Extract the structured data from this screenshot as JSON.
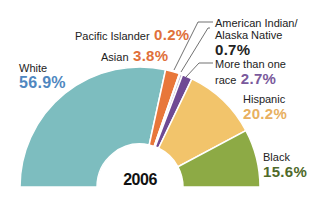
{
  "chart_data": {
    "type": "pie",
    "subtype": "half-donut",
    "title": "2006",
    "categories": [
      "White",
      "Asian",
      "Pacific Islander",
      "American Indian/Alaska Native",
      "More than one race",
      "Hispanic",
      "Black"
    ],
    "values": [
      56.9,
      3.8,
      0.2,
      0.7,
      2.7,
      20.2,
      15.6
    ],
    "unit": "%",
    "colors": [
      "#7dbdbf",
      "#e8773a",
      "#e8773a",
      "#c9c0d6",
      "#6f4a94",
      "#f2c46b",
      "#8daa45"
    ],
    "legend": "inline labels"
  },
  "labels": {
    "white": {
      "name": "White",
      "pct": "56.9%",
      "color": "#4f87c0"
    },
    "asian": {
      "name": "Asian",
      "pct": "3.8%",
      "color": "#e0703a"
    },
    "pacific": {
      "name": "Pacific Islander",
      "pct": "0.2%",
      "color": "#e0703a"
    },
    "amind": {
      "name1": "American Indian/",
      "name2": "Alaska Native",
      "pct": "0.7%",
      "color": "#222222"
    },
    "multi": {
      "name1": "More than one",
      "name2": "race",
      "pct": "2.7%",
      "color": "#7a5a9c"
    },
    "hispanic": {
      "name": "Hispanic",
      "pct": "20.2%",
      "color": "#e8b060"
    },
    "black": {
      "name": "Black",
      "pct": "15.6%",
      "color": "#4f6a2a"
    }
  },
  "year": "2006"
}
